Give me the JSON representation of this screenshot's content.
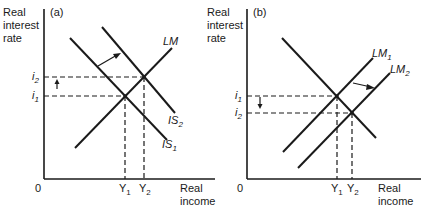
{
  "panels": [
    {
      "id": "a",
      "tag": "(a)",
      "y_axis_label": [
        "Real",
        "interest",
        "rate"
      ],
      "x_axis_label": [
        "Real",
        "income"
      ],
      "origin": "0",
      "curves": {
        "lm": {
          "name": "LM"
        },
        "is1": {
          "name": "IS",
          "sub": "1"
        },
        "is2": {
          "name": "IS",
          "sub": "2"
        }
      },
      "rates": {
        "i2": {
          "name": "i",
          "sub": "2"
        },
        "i1": {
          "name": "i",
          "sub": "1"
        }
      },
      "incomes": {
        "y1": {
          "name": "Y",
          "sub": "1"
        },
        "y2": {
          "name": "Y",
          "sub": "2"
        }
      }
    },
    {
      "id": "b",
      "tag": "(b)",
      "y_axis_label": [
        "Real",
        "interest",
        "rate"
      ],
      "x_axis_label": [
        "Real",
        "income"
      ],
      "origin": "0",
      "curves": {
        "lm1": {
          "name": "LM",
          "sub": "1"
        },
        "lm2": {
          "name": "LM",
          "sub": "2"
        }
      },
      "rates": {
        "i1": {
          "name": "i",
          "sub": "1"
        },
        "i2": {
          "name": "i",
          "sub": "2"
        }
      },
      "incomes": {
        "y1": {
          "name": "Y",
          "sub": "1"
        },
        "y2": {
          "name": "Y",
          "sub": "2"
        }
      }
    }
  ]
}
